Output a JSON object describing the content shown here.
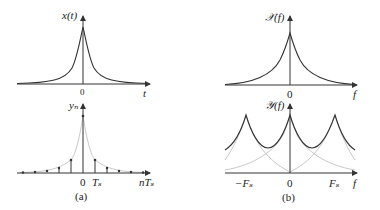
{
  "panels": {
    "a": {
      "caption": "(a)",
      "top": {
        "ylabel": "x(t)",
        "xlabel": "t",
        "origin": "0"
      },
      "bottom": {
        "ylabel": "yₙ",
        "xlabel": "nTₛ",
        "origin": "0",
        "tick": "Tₛ"
      }
    },
    "b": {
      "caption": "(b)",
      "top": {
        "ylabel": "𝒳(f)",
        "xlabel": "f",
        "origin": "0"
      },
      "bottom": {
        "ylabel": "𝒴(f)",
        "xlabel": "f",
        "origin": "0",
        "tick_neg": "−Fₛ",
        "tick_pos": "Fₛ"
      }
    }
  },
  "colors": {
    "curve": "#333333",
    "faint": "#c8c8c8",
    "axis": "#333333"
  }
}
